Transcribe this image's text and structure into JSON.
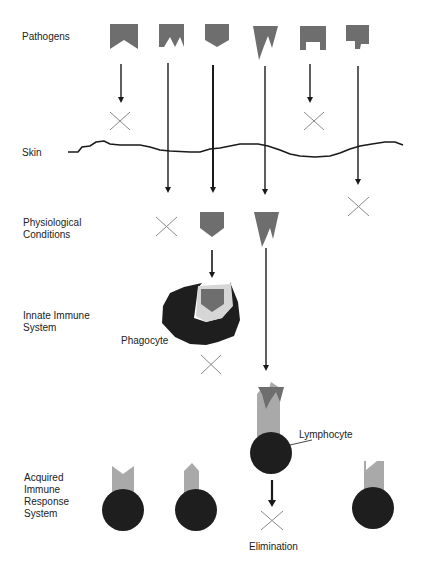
{
  "labels": {
    "pathogens": "Pathogens",
    "skin": "Skin",
    "physiological": "Physiological\nConditions",
    "innate": "Innate Immune\nSystem",
    "acquired": "Acquired\nImmune\nResponse\nSystem",
    "phagocyte": "Phagocyte",
    "lymphocyte": "Lymphocyte",
    "elimination": "Elimination"
  },
  "colors": {
    "pathogen": "#6e6e6e",
    "cell": "#1e1e1e",
    "receptor": "#a9a9a9",
    "line": "#1a1a1a",
    "cross": "#8a8a8a"
  },
  "pathogens": [
    {
      "id": 1,
      "shape": "notch-v",
      "fate": "blocked-at-skin"
    },
    {
      "id": 2,
      "shape": "double-notch",
      "fate": "blocked-by-physiological-conditions"
    },
    {
      "id": 3,
      "shape": "pentagon-point",
      "fate": "eliminated-by-phagocyte"
    },
    {
      "id": 4,
      "shape": "spiked-w",
      "fate": "eliminated-by-lymphocyte"
    },
    {
      "id": 5,
      "shape": "square-notch",
      "fate": "blocked-at-skin"
    },
    {
      "id": 6,
      "shape": "step-notch",
      "fate": "blocked-by-physiological-conditions"
    }
  ],
  "lymphocytes": [
    {
      "receptor": "v-notch"
    },
    {
      "receptor": "pointed"
    },
    {
      "receptor": "w-bound"
    },
    {
      "receptor": "step-notch"
    }
  ]
}
